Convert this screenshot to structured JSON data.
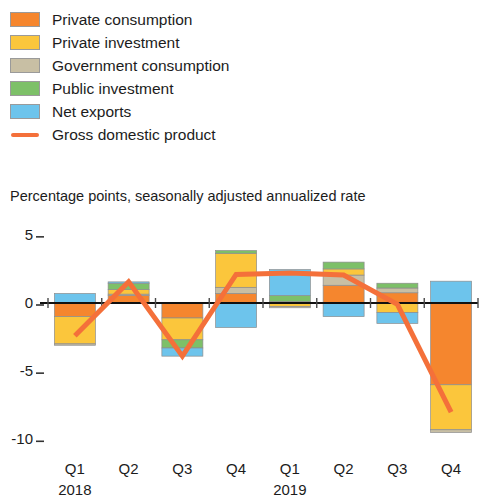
{
  "legend": {
    "items": [
      {
        "label": "Private consumption",
        "color": "#f5862e",
        "type": "swatch"
      },
      {
        "label": "Private investment",
        "color": "#fbc63c",
        "type": "swatch"
      },
      {
        "label": "Government consumption",
        "color": "#c8bfa4",
        "type": "swatch"
      },
      {
        "label": "Public investment",
        "color": "#7dc068",
        "type": "swatch"
      },
      {
        "label": "Net exports",
        "color": "#6dc4ec",
        "type": "swatch"
      },
      {
        "label": "Gross domestic product",
        "color": "#f4703a",
        "type": "line"
      }
    ]
  },
  "subtitle": "Percentage points, seasonally adjusted annualized rate",
  "axis": {
    "y_ticks": [
      "5",
      "0",
      "-5",
      "-10"
    ],
    "x_labels": [
      "Q1",
      "Q2",
      "Q3",
      "Q4",
      "Q1",
      "Q2",
      "Q3",
      "Q4"
    ],
    "year_labels": [
      {
        "text": "2018",
        "at_index": 0
      },
      {
        "text": "2019",
        "at_index": 4
      }
    ]
  },
  "chart_data": {
    "type": "bar",
    "title": "",
    "subtitle": "Percentage points, seasonally adjusted annualized rate",
    "xlabel": "",
    "ylabel": "Percentage points, seasonally adjusted annualized rate",
    "ylim": [
      -11,
      6
    ],
    "yticks": [
      5,
      0,
      -5,
      -10
    ],
    "grid": false,
    "legend_position": "top-left",
    "stacked": true,
    "categories": [
      "Q1 2018",
      "Q2 2018",
      "Q3 2018",
      "Q4 2018",
      "Q1 2019",
      "Q2 2019",
      "Q3 2019",
      "Q4 2019"
    ],
    "series": [
      {
        "name": "Private consumption",
        "color": "#f5862e",
        "values": [
          -1.0,
          0.55,
          -1.1,
          0.7,
          0.1,
          1.3,
          0.75,
          -6.0
        ]
      },
      {
        "name": "Private investment",
        "color": "#fbc63c",
        "values": [
          -2.0,
          0.35,
          -1.6,
          2.5,
          -0.25,
          0.45,
          -0.7,
          -3.3
        ]
      },
      {
        "name": "Government consumption",
        "color": "#c8bfa4",
        "values": [
          -0.1,
          0.1,
          0.0,
          0.45,
          -0.1,
          0.75,
          0.35,
          -0.2
        ]
      },
      {
        "name": "Public investment",
        "color": "#7dc068",
        "values": [
          0.0,
          0.45,
          -0.6,
          0.2,
          0.45,
          0.5,
          0.35,
          0.0
        ]
      },
      {
        "name": "Net exports",
        "color": "#6dc4ec",
        "values": [
          0.7,
          0.1,
          -0.6,
          -1.8,
          1.9,
          -1.0,
          -0.8,
          1.6
        ]
      }
    ],
    "line_series": {
      "name": "Gross domestic product",
      "color": "#f4703a",
      "values": [
        -2.4,
        1.55,
        -3.9,
        2.1,
        2.2,
        2.05,
        -0.1,
        -8.0
      ]
    }
  }
}
